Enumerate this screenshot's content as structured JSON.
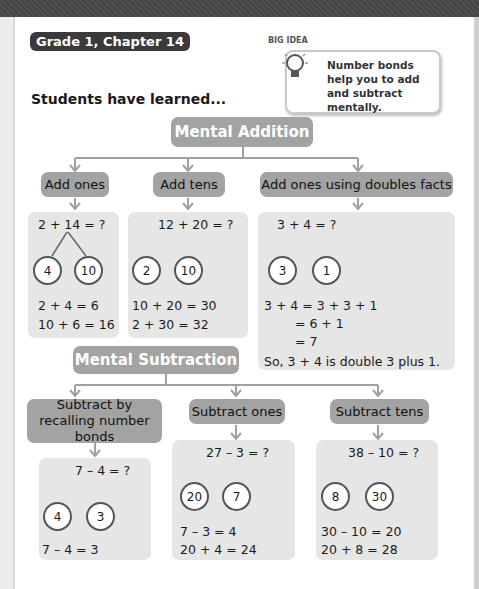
{
  "header": {
    "chapter_tag": "Grade 1, Chapter 14",
    "intro": "Students have learned...",
    "big_idea": {
      "label": "BIG IDEA",
      "text": "Number bonds help you to add and subtract mentally."
    }
  },
  "addition": {
    "title": "Mental Addition",
    "strategies": [
      {
        "label": "Add ones",
        "problem": "2 + 14 = ?",
        "bond": [
          "4",
          "10"
        ],
        "steps": [
          "2 + 4 = 6",
          "10 + 6 = 16"
        ]
      },
      {
        "label": "Add tens",
        "problem": "12 + 20 = ?",
        "bond": [
          "2",
          "10"
        ],
        "steps": [
          "10 + 20 = 30",
          "2 + 30 = 32"
        ]
      },
      {
        "label": "Add ones using doubles facts",
        "problem": "3 + 4 = ?",
        "bond": [
          "3",
          "1"
        ],
        "steps": [
          "3 + 4 = 3 + 3 + 1",
          "= 6 + 1",
          "= 7"
        ],
        "conclusion": "So, 3 + 4 is double 3 plus 1."
      }
    ]
  },
  "subtraction": {
    "title": "Mental Subtraction",
    "strategies": [
      {
        "label": "Subtract by recalling number bonds",
        "problem": "7 – 4 = ?",
        "bond": [
          "4",
          "3"
        ],
        "steps": [
          "7 – 4 = 3"
        ]
      },
      {
        "label": "Subtract ones",
        "problem": "27 – 3 = ?",
        "bond": [
          "20",
          "7"
        ],
        "steps": [
          "7 – 3 = 4",
          "20 + 4 = 24"
        ]
      },
      {
        "label": "Subtract tens",
        "problem": "38 – 10 = ?",
        "bond": [
          "8",
          "30"
        ],
        "steps": [
          "30 – 10 = 20",
          "20 + 8 = 28"
        ]
      }
    ]
  }
}
